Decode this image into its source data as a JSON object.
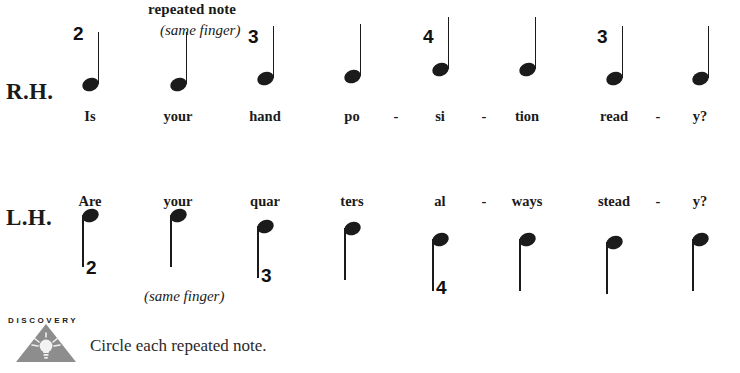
{
  "page": {
    "background": "#ffffff",
    "ink": "#1a1a1a"
  },
  "annotations": {
    "repeated_note_label": "repeated note",
    "same_finger_top": "(same finger)",
    "same_finger_bottom": "(same finger)"
  },
  "staves": [
    {
      "hand_label": "R.H.",
      "stem_direction": "up",
      "notes": [
        {
          "finger": "2",
          "lyric": "Is",
          "hyphen_after": ""
        },
        {
          "finger": "",
          "lyric": "your",
          "hyphen_after": ""
        },
        {
          "finger": "3",
          "lyric": "hand",
          "hyphen_after": ""
        },
        {
          "finger": "",
          "lyric": "po",
          "hyphen_after": "-"
        },
        {
          "finger": "4",
          "lyric": "si",
          "hyphen_after": "-"
        },
        {
          "finger": "",
          "lyric": "tion",
          "hyphen_after": ""
        },
        {
          "finger": "3",
          "lyric": "read",
          "hyphen_after": "-"
        },
        {
          "finger": "",
          "lyric": "y?",
          "hyphen_after": ""
        }
      ]
    },
    {
      "hand_label": "L.H.",
      "stem_direction": "down",
      "notes": [
        {
          "finger": "2",
          "lyric": "Are",
          "hyphen_after": ""
        },
        {
          "finger": "",
          "lyric": "your",
          "hyphen_after": ""
        },
        {
          "finger": "3",
          "lyric": "quar",
          "hyphen_after": "-"
        },
        {
          "finger": "",
          "lyric": "ters",
          "hyphen_after": ""
        },
        {
          "finger": "4",
          "lyric": "al",
          "hyphen_after": "-"
        },
        {
          "finger": "",
          "lyric": "ways",
          "hyphen_after": ""
        },
        {
          "finger": "",
          "lyric": "stead",
          "hyphen_after": "-"
        },
        {
          "finger": "",
          "lyric": "y?",
          "hyphen_after": ""
        }
      ]
    }
  ],
  "discovery": {
    "word": "DISCOVERY",
    "icon": "lightbulb-triangle-icon",
    "instruction": "Circle each repeated note.",
    "triangle_color": "#8d8d8d",
    "bulb_color": "#f2f2f2"
  }
}
